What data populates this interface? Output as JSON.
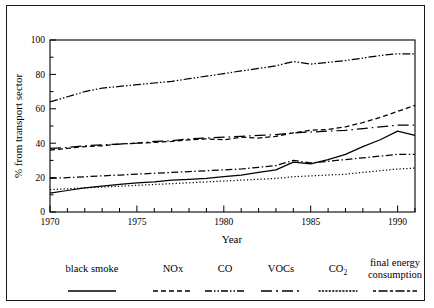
{
  "chart_data": {
    "type": "line",
    "title": "",
    "xlabel": "Year",
    "ylabel": "% from transport sector",
    "xlim": [
      1970,
      1991
    ],
    "ylim": [
      0,
      100
    ],
    "grid": false,
    "legend_position": "bottom",
    "x": [
      1970,
      1971,
      1972,
      1973,
      1974,
      1975,
      1976,
      1977,
      1978,
      1979,
      1980,
      1981,
      1982,
      1983,
      1984,
      1985,
      1986,
      1987,
      1988,
      1989,
      1990,
      1991
    ],
    "xticks_major": [
      1970,
      1975,
      1980,
      1985,
      1990
    ],
    "xtick_labels": [
      "1970",
      "1975",
      "1980",
      "1985",
      "1990"
    ],
    "yticks_major": [
      0,
      20,
      40,
      60,
      80,
      100
    ],
    "ytick_labels": [
      "0",
      "20",
      "40",
      "60",
      "80",
      "100"
    ],
    "yticks_minor": [
      10,
      30,
      50,
      70,
      90
    ],
    "series": [
      {
        "name": "CO",
        "dash": "8,2,1.5,2,1.5,2",
        "values": [
          64,
          67,
          70,
          72,
          73,
          74,
          75,
          76,
          77.5,
          79,
          80.5,
          82,
          83.5,
          85,
          87.5,
          86,
          87,
          88,
          89.5,
          91,
          92,
          92
        ]
      },
      {
        "name": "NOx",
        "dash": "5,3",
        "values": [
          36,
          37,
          38,
          38.5,
          39.5,
          40,
          40.5,
          41,
          42,
          42.5,
          42,
          43.5,
          43,
          44,
          46,
          47.5,
          48,
          49.5,
          52,
          55,
          58.5,
          62
        ]
      },
      {
        "name": "final energy consumption",
        "dash": "11,4,1.5,4",
        "values": [
          37,
          37.5,
          38.5,
          39,
          39.5,
          40,
          41,
          41.5,
          42.5,
          43,
          43.5,
          44,
          44.5,
          45,
          46,
          46.5,
          47,
          47.5,
          48.5,
          49.5,
          50.5,
          50.5
        ]
      },
      {
        "name": "black smoke",
        "dash": "0",
        "values": [
          11,
          12.5,
          14,
          15,
          16,
          17,
          17.5,
          18.5,
          19,
          19.5,
          20.5,
          21.5,
          23,
          24.5,
          29,
          28,
          30.5,
          33.5,
          38,
          42,
          47,
          44.5
        ]
      },
      {
        "name": "CO2",
        "dash": "7,2.5,1.5,2.5",
        "values": [
          19.5,
          20,
          20.5,
          21,
          21.5,
          22,
          22.5,
          23,
          23.5,
          24,
          24.5,
          25,
          26,
          27,
          30,
          28.5,
          29.5,
          30.5,
          31.5,
          32.5,
          33.5,
          33.5
        ]
      },
      {
        "name": "VOCs",
        "dash": "1.2,2.2",
        "values": [
          13,
          13.5,
          14,
          14.5,
          15,
          15.5,
          16,
          16.5,
          17,
          17.5,
          18,
          18.5,
          19,
          19.5,
          20.5,
          21,
          21.5,
          22,
          23,
          24,
          25,
          25.5
        ]
      }
    ]
  },
  "legend": {
    "entries": [
      {
        "label": "black smoke",
        "sub": "",
        "key": "solid"
      },
      {
        "label": "NOx",
        "sub": "",
        "key": "dashed"
      },
      {
        "label": "CO",
        "sub": "",
        "key": "dash-dot-dot"
      },
      {
        "label": "VOCs",
        "sub": "",
        "key": "long-dash"
      },
      {
        "label": "CO",
        "sub": "2",
        "key": "dotted"
      },
      {
        "label": "final energy",
        "sub": "consumption",
        "key": "dash-dot"
      }
    ]
  }
}
